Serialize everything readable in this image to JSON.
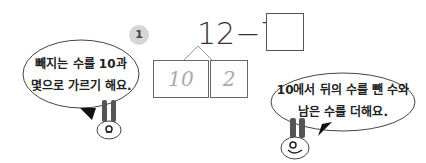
{
  "problem": {
    "number": "1",
    "equation": "12−7=",
    "answer": "",
    "decomposition": [
      "10",
      "2"
    ]
  },
  "bubbles": {
    "left": {
      "line1": "빼지는 수를 10과",
      "line2": "몇으로 가르기 해요."
    },
    "right": {
      "line1": "10에서 뒤의 수를 뺀 수와",
      "line2": "남은 수를 더해요."
    }
  },
  "characters": [
    "rabbit-left",
    "rabbit-right"
  ]
}
